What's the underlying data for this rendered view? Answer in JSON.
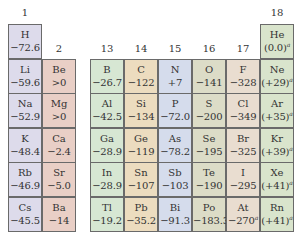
{
  "groups": {
    "g1": "1",
    "g2": "2",
    "g13": "13",
    "g14": "14",
    "g15": "15",
    "g16": "16",
    "g17": "17",
    "g18": "18"
  },
  "colors": {
    "g1": "#dddbeb",
    "g2": "#e9cfc6",
    "g13": "#d7e7d3",
    "g14": "#ecdcbf",
    "g15": "#d5dcec",
    "g16": "#dcdcc7",
    "g17": "#e9ddd0",
    "g18": "#d9e4cc"
  },
  "elements": {
    "H": {
      "symbol": "H",
      "value": "−72.6"
    },
    "Li": {
      "symbol": "Li",
      "value": "−59.6"
    },
    "Na": {
      "symbol": "Na",
      "value": "−52.9"
    },
    "K": {
      "symbol": "K",
      "value": "−48.4"
    },
    "Rb": {
      "symbol": "Rb",
      "value": "−46.9"
    },
    "Cs": {
      "symbol": "Cs",
      "value": "−45.5"
    },
    "Be": {
      "symbol": "Be",
      "value": ">0"
    },
    "Mg": {
      "symbol": "Mg",
      "value": ">0"
    },
    "Ca": {
      "symbol": "Ca",
      "value": "−2.4"
    },
    "Sr": {
      "symbol": "Sr",
      "value": "−5.0"
    },
    "Ba": {
      "symbol": "Ba",
      "value": "−14"
    },
    "B": {
      "symbol": "B",
      "value": "−26.7"
    },
    "Al": {
      "symbol": "Al",
      "value": "−42.5"
    },
    "Ga": {
      "symbol": "Ga",
      "value": "−28.9"
    },
    "In": {
      "symbol": "In",
      "value": "−28.9"
    },
    "Tl": {
      "symbol": "Tl",
      "value": "−19.2"
    },
    "C": {
      "symbol": "C",
      "value": "−122"
    },
    "Si": {
      "symbol": "Si",
      "value": "−134"
    },
    "Ge": {
      "symbol": "Ge",
      "value": "−119"
    },
    "Sn": {
      "symbol": "Sn",
      "value": "−107"
    },
    "Pb": {
      "symbol": "Pb",
      "value": "−35.2"
    },
    "N": {
      "symbol": "N",
      "value": "+7"
    },
    "P": {
      "symbol": "P",
      "value": "−72.0"
    },
    "As": {
      "symbol": "As",
      "value": "−78.2"
    },
    "Sb": {
      "symbol": "Sb",
      "value": "−103"
    },
    "Bi": {
      "symbol": "Bi",
      "value": "−91.3"
    },
    "O": {
      "symbol": "O",
      "value": "−141"
    },
    "S": {
      "symbol": "S",
      "value": "−200"
    },
    "Se": {
      "symbol": "Se",
      "value": "−195"
    },
    "Te": {
      "symbol": "Te",
      "value": "−190"
    },
    "Po": {
      "symbol": "Po",
      "value": "−183.3"
    },
    "F": {
      "symbol": "F",
      "value": "−328"
    },
    "Cl": {
      "symbol": "Cl",
      "value": "−349"
    },
    "Br": {
      "symbol": "Br",
      "value": "−325"
    },
    "I": {
      "symbol": "I",
      "value": "−295"
    },
    "At": {
      "symbol": "At",
      "value": "−270",
      "note": "a"
    },
    "He": {
      "symbol": "He",
      "value": "(0.0)",
      "note": "a"
    },
    "Ne": {
      "symbol": "Ne",
      "value": "(+29)",
      "note": "a"
    },
    "Ar": {
      "symbol": "Ar",
      "value": "(+35)",
      "note": "a"
    },
    "Kr": {
      "symbol": "Kr",
      "value": "(+39)",
      "note": "a"
    },
    "Xe": {
      "symbol": "Xe",
      "value": "(+41)",
      "note": "a"
    },
    "Rn": {
      "symbol": "Rn",
      "value": "(+41)",
      "note": "a"
    }
  }
}
